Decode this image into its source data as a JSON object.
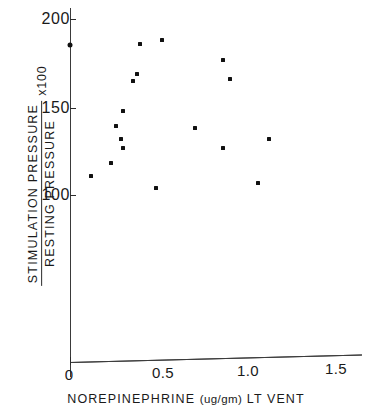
{
  "chart_data": {
    "type": "scatter",
    "title": "",
    "xlabel": "NOREPINEPHRINE (ug/gm) LT VENT",
    "ylabel": "STIMULATION PRESSURE / RESTING PRESSURE  x100",
    "ylabel_numerator": "STIMULATION PRESSURE",
    "ylabel_denominator": "RESTING PRESSURE",
    "ylabel_multiplier": "x100",
    "xlim": [
      0,
      1.62
    ],
    "ylim": [
      0,
      206
    ],
    "xticks": [
      0,
      0.5,
      1.0,
      1.5
    ],
    "xtick_labels": [
      "0",
      "0.5",
      "1.0",
      "1.5"
    ],
    "yticks": [
      100,
      150,
      200
    ],
    "ytick_labels": [
      "100",
      "150",
      "200"
    ],
    "grid": false,
    "legend": null,
    "marker": "square-dot",
    "marker_color": "#111111",
    "axis_color": "#2b2b2b",
    "points": [
      {
        "x": 0.0,
        "y": 185
      },
      {
        "x": 0.12,
        "y": 111
      },
      {
        "x": 0.23,
        "y": 118
      },
      {
        "x": 0.26,
        "y": 139
      },
      {
        "x": 0.29,
        "y": 132
      },
      {
        "x": 0.3,
        "y": 148
      },
      {
        "x": 0.3,
        "y": 127
      },
      {
        "x": 0.36,
        "y": 165
      },
      {
        "x": 0.38,
        "y": 169
      },
      {
        "x": 0.4,
        "y": 186
      },
      {
        "x": 0.49,
        "y": 104
      },
      {
        "x": 0.52,
        "y": 188
      },
      {
        "x": 0.71,
        "y": 138
      },
      {
        "x": 0.87,
        "y": 177
      },
      {
        "x": 0.87,
        "y": 127
      },
      {
        "x": 0.91,
        "y": 166
      },
      {
        "x": 1.07,
        "y": 107
      },
      {
        "x": 1.13,
        "y": 132
      }
    ]
  },
  "xaxis_title_parts": {
    "main": "NOREPINEPHRINE",
    "units": "(ug/gm)",
    "suffix": "LT VENT"
  }
}
